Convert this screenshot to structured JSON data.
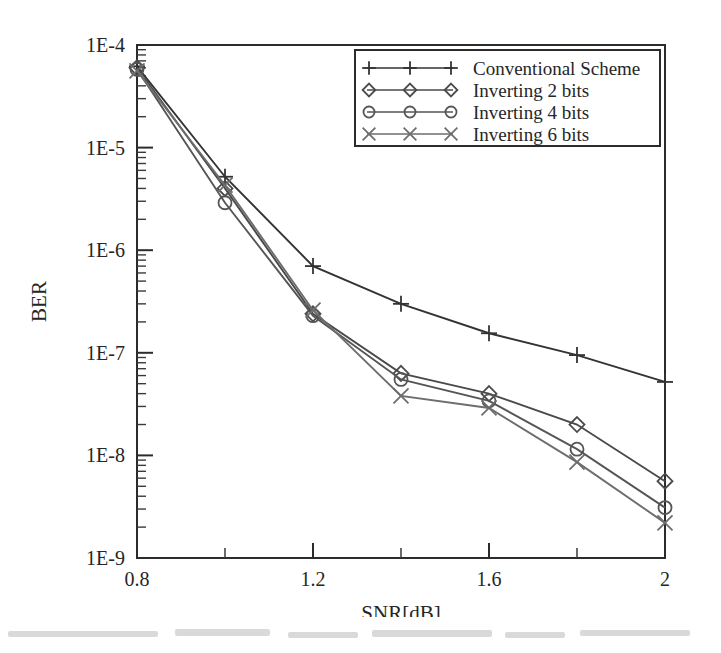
{
  "chart_data": {
    "type": "line",
    "title": "",
    "xlabel": "SNR[dB]",
    "ylabel": "BER",
    "xlim": [
      0.8,
      2.0
    ],
    "ylim": [
      1e-09,
      0.0001
    ],
    "yscale": "log",
    "xscale": "linear",
    "grid": false,
    "legend_position": "top-right",
    "x_tick_labels": [
      "0.8",
      "1.2",
      "1.6",
      "2"
    ],
    "x_tick_values": [
      0.8,
      1.2,
      1.6,
      2.0
    ],
    "x_minor_tick_values": [
      1.0,
      1.4,
      1.8
    ],
    "y_tick_labels": [
      "1E-4",
      "1E-5",
      "1E-6",
      "1E-7",
      "1E-8",
      "1E-9"
    ],
    "y_tick_values": [
      0.0001,
      1e-05,
      1e-06,
      1e-07,
      1e-08,
      1e-09
    ],
    "x": [
      0.8,
      1.0,
      1.2,
      1.4,
      1.6,
      1.8,
      2.0
    ],
    "series": [
      {
        "name": "Conventional Scheme",
        "marker": "plus",
        "color": "#333333",
        "values": [
          6.2e-05,
          5.2e-06,
          7e-07,
          3e-07,
          1.55e-07,
          9.5e-08,
          5.2e-08
        ]
      },
      {
        "name": "Inverting 2 bits",
        "marker": "diamond",
        "color": "#4a4a4a",
        "values": [
          6e-05,
          4e-06,
          2.4e-07,
          6.3e-08,
          4e-08,
          2e-08,
          5.6e-09
        ]
      },
      {
        "name": "Inverting 4 bits",
        "marker": "circle",
        "color": "#555555",
        "values": [
          5.8e-05,
          2.9e-06,
          2.3e-07,
          5.5e-08,
          3.4e-08,
          1.15e-08,
          3.1e-09
        ]
      },
      {
        "name": "Inverting 6 bits",
        "marker": "cross",
        "color": "#6d6d6d",
        "values": [
          5.6e-05,
          4.3e-06,
          2.6e-07,
          3.8e-08,
          2.9e-08,
          8.6e-09,
          2.2e-09
        ]
      }
    ]
  }
}
